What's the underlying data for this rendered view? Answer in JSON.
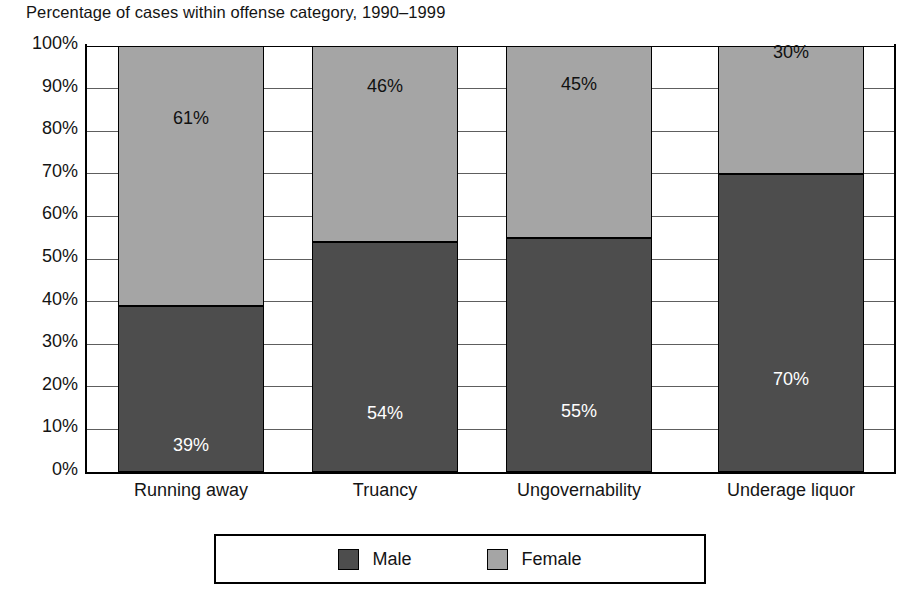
{
  "chart_data": {
    "type": "bar",
    "subtype": "stacked-bar-100-percent",
    "title": "Percentage of cases within offense category, 1990–1999",
    "xlabel": "",
    "ylabel": "",
    "ylim": [
      0,
      100
    ],
    "grid": true,
    "legend_position": "bottom",
    "categories": [
      "Running away",
      "Truancy",
      "Ungovernability",
      "Underage liquor"
    ],
    "ytick_labels": [
      "100%",
      "90%",
      "80%",
      "70%",
      "60%",
      "50%",
      "40%",
      "30%",
      "20%",
      "10%",
      "0%"
    ],
    "ytick_values": [
      100,
      90,
      80,
      70,
      60,
      50,
      40,
      30,
      20,
      10,
      0
    ],
    "series": [
      {
        "name": "Male",
        "color": "#4d4d4d",
        "values": [
          39,
          54,
          55,
          70
        ],
        "data_labels": [
          "39%",
          "54%",
          "55%",
          "70%"
        ],
        "label_color": "#ffffff"
      },
      {
        "name": "Female",
        "color": "#a5a5a5",
        "values": [
          61,
          46,
          45,
          30
        ],
        "data_labels": [
          "61%",
          "46%",
          "45%",
          "30%"
        ],
        "label_color": "#111111"
      }
    ]
  },
  "legend": {
    "entries": [
      {
        "label": "Male",
        "color": "#4d4d4d"
      },
      {
        "label": "Female",
        "color": "#a5a5a5"
      }
    ]
  }
}
